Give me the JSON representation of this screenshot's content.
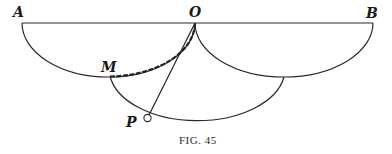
{
  "figure": {
    "caption": "Fig. 45",
    "caption_display": "FIG. 45",
    "labels": {
      "A": "A",
      "O": "O",
      "B": "B",
      "M": "M",
      "P": "P"
    },
    "colors": {
      "stroke": "#2a2a2a",
      "background": "#ffffff"
    },
    "elements": [
      "diameter line AB through O",
      "semicircle on AO (below line)",
      "semicircle on OB (below line)",
      "arc from M through P to bottom of semicircle OB",
      "thick marked arc M to O",
      "segment O to P",
      "small open circle at P"
    ]
  }
}
